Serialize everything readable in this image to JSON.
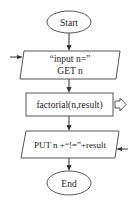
{
  "diagram": {
    "type": "flowchart",
    "nodes": [
      {
        "id": "start",
        "shape": "ellipse",
        "label": "Start"
      },
      {
        "id": "input",
        "shape": "parallelogram",
        "lines": [
          "“input n=”",
          "GET n"
        ],
        "io": "input"
      },
      {
        "id": "process",
        "shape": "rectangle",
        "label": "factorial(n,result)",
        "call": true
      },
      {
        "id": "output",
        "shape": "parallelogram",
        "label": "PUT n +“!=”+result",
        "io": "output"
      },
      {
        "id": "end",
        "shape": "ellipse",
        "label": "End"
      }
    ],
    "edges": [
      {
        "from": "start",
        "to": "input"
      },
      {
        "from": "input",
        "to": "process"
      },
      {
        "from": "process",
        "to": "output"
      },
      {
        "from": "output",
        "to": "end"
      }
    ],
    "colors": {
      "stroke": "#555555",
      "fill": "#ffffff",
      "text": "#222222"
    }
  }
}
